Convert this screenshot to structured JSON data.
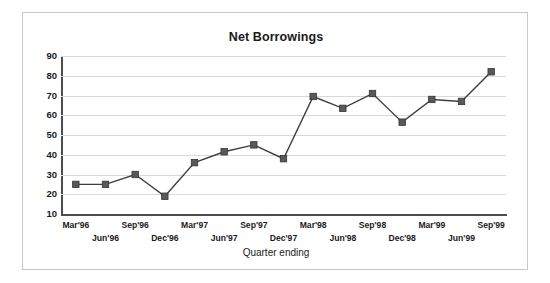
{
  "chart_data": {
    "type": "line",
    "title": "Net Borrowings",
    "xlabel": "Quarter ending",
    "ylabel": "",
    "ylim": [
      10,
      90
    ],
    "ytick_step": 10,
    "yticks": [
      90,
      80,
      70,
      60,
      50,
      40,
      30,
      20,
      10
    ],
    "grid": true,
    "legend": null,
    "categories": [
      "Mar'96",
      "Jun'96",
      "Sep'96",
      "Dec'96",
      "Mar'97",
      "Jun'97",
      "Sep'97",
      "Dec'97",
      "Mar'98",
      "Jun'98",
      "Sep'98",
      "Dec'98",
      "Mar'99",
      "Jun'99",
      "Sep'99"
    ],
    "values": [
      25,
      25,
      30,
      19,
      36,
      41.5,
      45,
      38,
      69.5,
      63.5,
      71,
      56.5,
      68,
      67,
      82
    ],
    "series": [
      {
        "name": "Net Borrowings",
        "values": [
          25,
          25,
          30,
          19,
          36,
          41.5,
          45,
          38,
          69.5,
          63.5,
          71,
          56.5,
          68,
          67,
          82
        ],
        "marker": "square",
        "line_color": "#3f3f3f",
        "marker_color": "#595959"
      }
    ]
  },
  "style": {
    "frame_border_color": "#c8c8c8",
    "axis_color": "#4d4d4d",
    "gridline_color": "#d9d9d9",
    "text_color": "#1a1a1a",
    "background": "#ffffff"
  }
}
